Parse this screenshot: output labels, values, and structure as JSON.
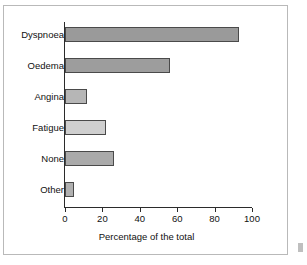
{
  "chart_data": {
    "type": "bar",
    "orientation": "horizontal",
    "title": "",
    "xlabel": "Percentage of the total",
    "ylabel": "",
    "categories": [
      "Dyspnoea",
      "Oedema",
      "Angina",
      "Fatigue",
      "None",
      "Other"
    ],
    "values": [
      93,
      56,
      12,
      22,
      26,
      5
    ],
    "xlim": [
      0,
      100
    ],
    "xticks": [
      0,
      20,
      40,
      60,
      80,
      100
    ],
    "xtick_labels": [
      "0",
      "20",
      "40",
      "60",
      "80",
      "100"
    ],
    "grid": false,
    "legend": false,
    "bar_colors": [
      "#9a9a9a",
      "#9d9d9d",
      "#b6b6b6",
      "#cfcfcf",
      "#aaaaaa",
      "#b0b0b0"
    ],
    "bar_edge_color": "#4a4a4a",
    "axis_color": "#2b2b2b",
    "frame_color": "#b9b9b9",
    "background": "#ffffff"
  }
}
